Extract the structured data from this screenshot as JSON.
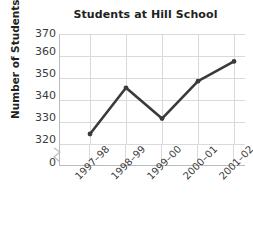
{
  "chart_data": {
    "type": "line",
    "title": "Students at Hill School",
    "xlabel": "",
    "ylabel": "Number of Students",
    "categories": [
      "1997–98",
      "1998–99",
      "1999–00",
      "2000–01",
      "2001–02"
    ],
    "values": [
      325,
      346,
      332,
      349,
      358
    ],
    "series": [
      {
        "name": "Students at Hill School",
        "values": [
          325,
          346,
          332,
          349,
          358
        ]
      }
    ],
    "ylim": [
      320,
      370
    ],
    "yticks": [
      370,
      360,
      350,
      340,
      330,
      320,
      0
    ],
    "ytick_labels": [
      "370",
      "360",
      "350",
      "340",
      "330",
      "320",
      "0"
    ],
    "axis_break": true,
    "axis_break_note": "y-axis broken between 0 and 320",
    "grid": true,
    "legend": "none",
    "marker": "circle",
    "line_color": "#3a3a3c",
    "grid_color": "#d8dadc",
    "axis_color": "#b9bcbe",
    "text_color": "#231f20"
  }
}
